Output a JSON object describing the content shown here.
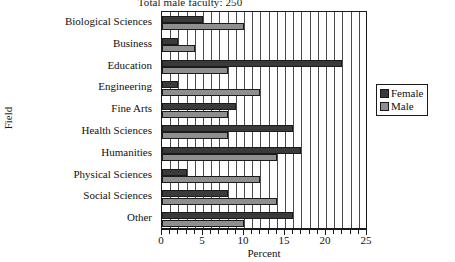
{
  "chart_data": {
    "type": "bar",
    "orientation": "horizontal",
    "title": "Total male faculty:  250",
    "xlabel": "Percent",
    "ylabel": "Field",
    "xlim": [
      0,
      25
    ],
    "xticks": [
      0,
      5,
      10,
      15,
      20,
      25
    ],
    "xtick_labels": [
      "0",
      "5",
      "10",
      "15",
      "20",
      "25"
    ],
    "minor_tick_step": 1,
    "grid": true,
    "grid_axis": "x",
    "legend_position": "right",
    "categories": [
      "Biological Sciences",
      "Business",
      "Education",
      "Engineering",
      "Fine Arts",
      "Health Sciences",
      "Humanities",
      "Physical Sciences",
      "Social Sciences",
      "Other"
    ],
    "series": [
      {
        "name": "Female",
        "color": "#3a3a3a",
        "values": [
          5,
          2,
          22,
          2,
          9,
          16,
          17,
          3,
          8,
          16
        ]
      },
      {
        "name": "Male",
        "color": "#8f8f8f",
        "values": [
          10,
          4,
          8,
          12,
          8,
          8,
          14,
          12,
          14,
          10
        ]
      }
    ]
  },
  "legend": {
    "entries": [
      {
        "label": "Female",
        "swatch": "female"
      },
      {
        "label": "Male",
        "swatch": "male"
      }
    ]
  }
}
